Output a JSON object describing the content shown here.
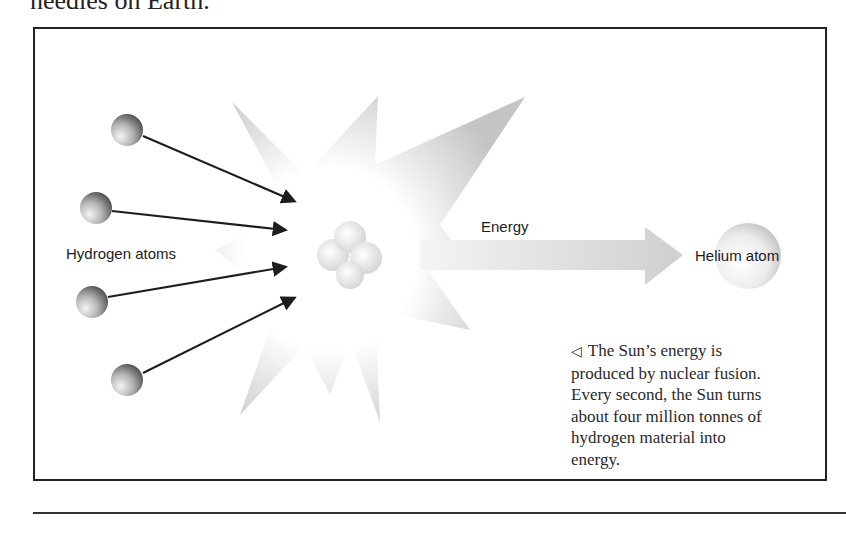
{
  "page": {
    "top_text": "needles on Earth."
  },
  "figure": {
    "labels": {
      "hydrogen": "Hydrogen atoms",
      "energy": "Energy",
      "helium": "Helium atom"
    },
    "caption": {
      "marker": "◁",
      "lines": [
        "The Sun’s energy is",
        "produced by nuclear fusion.",
        "Every second, the Sun turns",
        "about four million tonnes of",
        "hydrogen material into",
        "energy."
      ]
    },
    "icons": {
      "hydrogen_atoms": [
        "sphere-icon",
        "sphere-icon",
        "sphere-icon",
        "sphere-icon"
      ],
      "arrows": [
        "arrow-right-icon",
        "arrow-right-icon",
        "arrow-right-icon",
        "arrow-right-icon"
      ],
      "burst": "starburst-icon",
      "nucleus": "nucleus-cluster-icon",
      "energy_arrow": "block-arrow-right-icon",
      "helium_atom": "sphere-icon"
    },
    "colors": {
      "border": "#222222",
      "arrow": "#1e1e1e",
      "burst_edge": "#c9c9c9",
      "text": "#1c1c1c"
    }
  }
}
